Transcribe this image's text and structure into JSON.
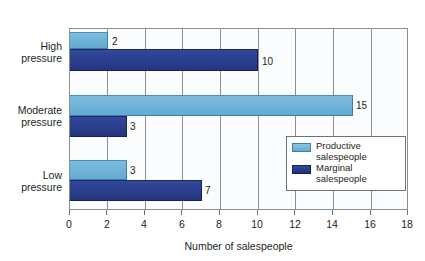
{
  "chart_data": {
    "type": "bar",
    "orientation": "horizontal",
    "title": "",
    "xlabel": "Number of salespeople",
    "ylabel": "",
    "xlim": [
      0,
      18
    ],
    "xticks": [
      "0",
      "2",
      "4",
      "6",
      "8",
      "10",
      "12",
      "14",
      "16",
      "18"
    ],
    "xtick_step": 2,
    "grid": true,
    "legend_position": "inside-right",
    "categories": [
      "High pressure",
      "Moderate pressure",
      "Low pressure"
    ],
    "category_lines": [
      [
        "High",
        "pressure"
      ],
      [
        "Moderate",
        "pressure"
      ],
      [
        "Low",
        "pressure"
      ]
    ],
    "series": [
      {
        "name": "Productive salespeople",
        "name_lines": [
          "Productive",
          "salespeople"
        ],
        "color": "#68AFD5",
        "values": [
          2,
          15,
          3
        ],
        "value_labels": [
          "2",
          "15",
          "3"
        ]
      },
      {
        "name": "Marginal salespeople",
        "name_lines": [
          "Marginal",
          "salespeople"
        ],
        "color": "#283C8F",
        "values": [
          10,
          3,
          7
        ],
        "value_labels": [
          "10",
          "3",
          "7"
        ]
      }
    ]
  },
  "colors": {
    "light_blue": "#68AFD5",
    "dark_navy": "#283C8F",
    "axis": "#8A8F94",
    "text": "#231F20",
    "plot_background": "#FBFCFD"
  },
  "bars": [
    {
      "label": "2",
      "value": 2,
      "series": "productive",
      "group": "high"
    },
    {
      "label": "10",
      "value": 10,
      "series": "marginal",
      "group": "high"
    },
    {
      "label": "15",
      "value": 15,
      "series": "productive",
      "group": "moderate"
    },
    {
      "label": "3",
      "value": 3,
      "series": "marginal",
      "group": "moderate"
    },
    {
      "label": "3",
      "value": 3,
      "series": "productive",
      "group": "low"
    },
    {
      "label": "7",
      "value": 7,
      "series": "marginal",
      "group": "low"
    }
  ],
  "legend": {
    "items": [
      {
        "swatch": "light",
        "line1": "Productive",
        "line2": "salespeople"
      },
      {
        "swatch": "dark",
        "line1": "Marginal",
        "line2": "salespeople"
      }
    ]
  },
  "axis": {
    "title": "Number of salespeople",
    "ticks": [
      "0",
      "2",
      "4",
      "6",
      "8",
      "10",
      "12",
      "14",
      "16",
      "18"
    ]
  }
}
